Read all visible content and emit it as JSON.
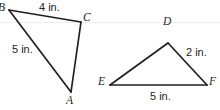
{
  "figure": {
    "kind": "geometry-diagram",
    "background_color": "#ffffff",
    "stroke_color": "#231f20",
    "text_color": "#231f20",
    "guide_line_color": "#eceef0",
    "width": 220,
    "height": 110
  },
  "triangles": [
    {
      "id": "triangle-abc",
      "name": "triangle ABC",
      "vertices": [
        {
          "label": "B",
          "x": 9,
          "y": 10,
          "label_x": -2,
          "label_y": 2
        },
        {
          "label": "C",
          "x": 81,
          "y": 22,
          "label_x": 83,
          "label_y": 12
        },
        {
          "label": "A",
          "x": 71,
          "y": 92,
          "label_x": 66,
          "label_y": 95
        }
      ],
      "sides": [
        {
          "from": "B",
          "to": "C",
          "measure": "4 in.",
          "label_x": 39,
          "label_y": 2
        },
        {
          "from": "B",
          "to": "A",
          "measure": "5 in.",
          "label_x": 12,
          "label_y": 44
        },
        {
          "from": "C",
          "to": "A",
          "measure": "",
          "label_x": 0,
          "label_y": 0
        }
      ]
    },
    {
      "id": "triangle-def",
      "name": "triangle DEF",
      "vertices": [
        {
          "label": "D",
          "x": 168,
          "y": 43,
          "label_x": 163,
          "label_y": 16
        },
        {
          "label": "E",
          "x": 110,
          "y": 85,
          "label_x": 98,
          "label_y": 76
        },
        {
          "label": "F",
          "x": 207,
          "y": 85,
          "label_x": 209,
          "label_y": 76
        }
      ],
      "sides": [
        {
          "from": "D",
          "to": "F",
          "measure": "2 in.",
          "label_x": 186,
          "label_y": 47
        },
        {
          "from": "E",
          "to": "F",
          "measure": "5 in.",
          "label_x": 150,
          "label_y": 91
        },
        {
          "from": "D",
          "to": "E",
          "measure": "",
          "label_x": 0,
          "label_y": 0
        }
      ]
    }
  ],
  "guide_line": {
    "name": "faint-horizontal-rule",
    "y": 22
  }
}
